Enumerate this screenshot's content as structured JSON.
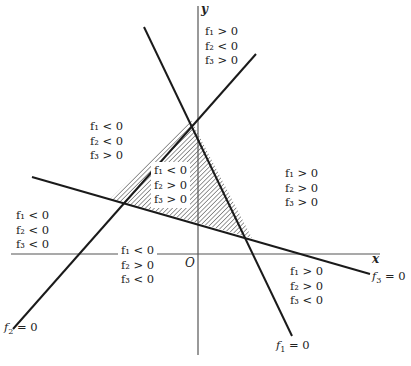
{
  "diagram": {
    "type": "linear-inequality-regions",
    "axes": {
      "x_label": "x",
      "y_label": "y",
      "origin_label": "O"
    },
    "lines": [
      {
        "id": "f1",
        "label": "f₁ = 0",
        "name": "f",
        "sub": "1",
        "eq": "= 0"
      },
      {
        "id": "f2",
        "label": "f₂ = 0",
        "name": "f",
        "sub": "2",
        "eq": "= 0"
      },
      {
        "id": "f3",
        "label": "f₃ = 0",
        "name": "f",
        "sub": "3",
        "eq": "= 0"
      }
    ],
    "shaded_region": {
      "description": "triangle bounded by f1=0, f2=0, f3=0",
      "conditions": [
        "f₁ < 0",
        "f₂ > 0",
        "f₃ > 0"
      ]
    },
    "regions": {
      "top": [
        "f₁ > 0",
        "f₂ < 0",
        "f₃ > 0"
      ],
      "upper_left": [
        "f₁ < 0",
        "f₂ < 0",
        "f₃ > 0"
      ],
      "center_triangle": [
        "f₁ < 0",
        "f₂ > 0",
        "f₃ > 0"
      ],
      "right": [
        "f₁ > 0",
        "f₂ > 0",
        "f₃ > 0"
      ],
      "far_left": [
        "f₁ < 0",
        "f₂ < 0",
        "f₃ < 0"
      ],
      "lower_middle": [
        "f₁ < 0",
        "f₂ > 0",
        "f₃ < 0"
      ],
      "lower_right": [
        "f₁ > 0",
        "f₂ > 0",
        "f₃ < 0"
      ]
    },
    "colors": {
      "line": "#1a1a1a",
      "axis": "#555555",
      "hatch": "#444444",
      "background": "#ffffff"
    }
  }
}
